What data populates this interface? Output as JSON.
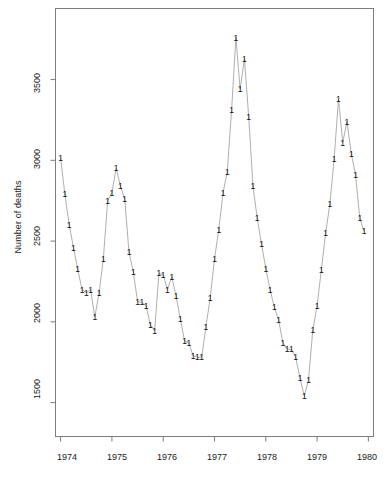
{
  "chart_data": {
    "type": "line",
    "title": "",
    "xlabel": "",
    "ylabel": "Number of deaths",
    "xlim": [
      1973.9,
      1980.1
    ],
    "ylim": [
      1290,
      3940
    ],
    "grid": false,
    "legend": false,
    "point_marker": "1",
    "line_color": "#9a9a9a",
    "marker_color": "#111111",
    "xticks": [
      1974,
      1975,
      1976,
      1977,
      1978,
      1979,
      1980
    ],
    "xtick_labels": [
      "1974",
      "1975",
      "1976",
      "1977",
      "1978",
      "1979",
      "1980"
    ],
    "yticks": [
      1500,
      2000,
      2500,
      3000,
      3500
    ],
    "ytick_labels": [
      "1500",
      "2000",
      "2500",
      "3000",
      "3500"
    ],
    "x": [
      1974.0,
      1974.083,
      1974.167,
      1974.25,
      1974.333,
      1974.417,
      1974.5,
      1974.583,
      1974.667,
      1974.75,
      1974.833,
      1974.917,
      1975.0,
      1975.083,
      1975.167,
      1975.25,
      1975.333,
      1975.417,
      1975.5,
      1975.583,
      1975.667,
      1975.75,
      1975.833,
      1975.917,
      1976.0,
      1976.083,
      1976.167,
      1976.25,
      1976.333,
      1976.417,
      1976.5,
      1976.583,
      1976.667,
      1976.75,
      1976.833,
      1976.917,
      1977.0,
      1977.083,
      1977.167,
      1977.25,
      1977.333,
      1977.417,
      1977.5,
      1977.583,
      1977.667,
      1977.75,
      1977.833,
      1977.917,
      1978.0,
      1978.083,
      1978.167,
      1978.25,
      1978.333,
      1978.417,
      1978.5,
      1978.583,
      1978.667,
      1978.75,
      1978.833,
      1978.917,
      1979.0,
      1979.083,
      1979.167,
      1979.25,
      1979.333,
      1979.417,
      1979.5,
      1979.583,
      1979.667,
      1979.75,
      1979.833,
      1979.917
    ],
    "values": [
      3015,
      2790,
      2600,
      2460,
      2325,
      2200,
      2180,
      2200,
      2030,
      2180,
      2390,
      2750,
      2800,
      2950,
      2840,
      2760,
      2430,
      2310,
      2125,
      2120,
      2100,
      1980,
      1945,
      2300,
      2290,
      2200,
      2280,
      2160,
      2020,
      1880,
      1870,
      1790,
      1780,
      1780,
      1970,
      2150,
      2390,
      2570,
      2800,
      2930,
      3310,
      3760,
      3440,
      3630,
      3270,
      2840,
      2640,
      2480,
      2330,
      2200,
      2090,
      2010,
      1870,
      1830,
      1830,
      1780,
      1650,
      1540,
      1640,
      1950,
      2100,
      2320,
      2550,
      2730,
      3010,
      3380,
      3110,
      3240,
      3040,
      2910,
      2640,
      2560
    ],
    "series_name": "UK driver deaths (monthly)",
    "n_points": 72,
    "y_min_observed": 1300,
    "y_max_observed": 3900
  },
  "axes": {
    "y_title": "Number of deaths"
  }
}
